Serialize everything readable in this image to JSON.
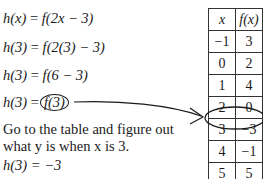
{
  "steps": [
    {
      "lhs": "h(x)",
      "rhs": "f(2x − 3)"
    },
    {
      "lhs": "h(3)",
      "rhs": "f(2(3) − 3)"
    },
    {
      "lhs": "h(3)",
      "rhs": "f(6 − 3)"
    },
    {
      "lhs": "h(3)",
      "rhs": "f(3)"
    }
  ],
  "eq": "=",
  "note": "Go to the table and figure out what y is when x is 3.",
  "answer": "h(3) = −3",
  "table": {
    "headers": [
      "x",
      "f(x)"
    ],
    "rows": [
      [
        "−1",
        "3"
      ],
      [
        "0",
        "2"
      ],
      [
        "1",
        "4"
      ],
      [
        "2",
        "0"
      ],
      [
        "3",
        "−3"
      ],
      [
        "4",
        "−1"
      ],
      [
        "5",
        "5"
      ]
    ],
    "highlighted_row": 4
  }
}
